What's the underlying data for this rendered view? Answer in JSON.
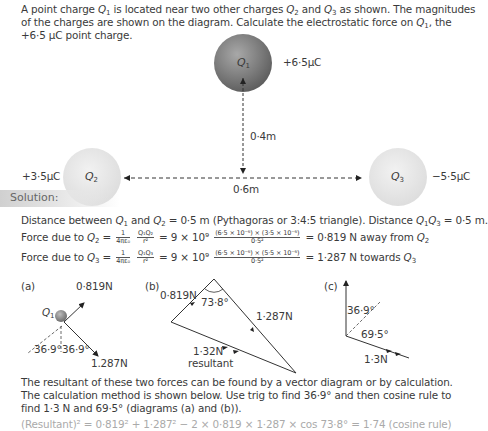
{
  "problem": {
    "text_parts": [
      "A point charge ",
      "Q",
      "1",
      " is located near two other charges ",
      "Q",
      "2",
      " and ",
      "Q",
      "3",
      " as shown. The magnitudes of the charges are shown on the diagram. Calculate the electrostatic force on ",
      "Q",
      "1",
      ", the +6·5 μC point charge."
    ]
  },
  "diagram": {
    "q1": {
      "label": "Q",
      "sub": "1",
      "charge": "+6·5μC",
      "color": "#777777"
    },
    "q2": {
      "label": "Q",
      "sub": "2",
      "charge": "+3·5μC",
      "color": "#e2e2e2"
    },
    "q3": {
      "label": "Q",
      "sub": "3",
      "charge": "−5·5μC",
      "color": "#e2e2e2"
    },
    "vertical_distance": "0·4m",
    "horizontal_distance": "0·6m"
  },
  "solution": {
    "heading": "Solution:",
    "line1": [
      "Distance between ",
      "Q",
      "1",
      " and ",
      "Q",
      "2",
      " = 0·5 m (Pythagoras or 3:4:5 triangle). Distance ",
      "Q",
      "1",
      "Q",
      "3",
      " = 0·5 m."
    ],
    "force_q2": {
      "prefix": "Force due to ",
      "q": "Q",
      "qsub": "2",
      "const_num": "1",
      "const_den": "4πε₀",
      "ratio_num": "Q₁Q₂",
      "ratio_den": "r²",
      "k": "= 9 × 10⁹",
      "num": "(6·5 × 10⁻⁶) × (3·5 × 10⁻⁶)",
      "den": "0·5²",
      "result": "= 0·819 N away from ",
      "target": "Q",
      "target_sub": "2"
    },
    "force_q3": {
      "prefix": "Force due to ",
      "q": "Q",
      "qsub": "3",
      "const_num": "1",
      "const_den": "4πε₀",
      "ratio_num": "Q₁Q₃",
      "ratio_den": "r²",
      "k": "= 9 × 10⁹",
      "num": "(6·5 × 10⁻⁶) × (5·5 × 10⁻⁶)",
      "den": "0·5²",
      "result": "= 1·287 N towards ",
      "target": "Q",
      "target_sub": "3"
    },
    "fig_a": {
      "label": "(a)",
      "f1": "0·819N",
      "f2": "1.287N",
      "q": "Q",
      "qsub": "1",
      "ang1": "36·9°",
      "ang2": "36·9°"
    },
    "fig_b": {
      "label": "(b)",
      "f1": "0·819N",
      "angle": "73·8°",
      "f2": "1·287N",
      "res": "1·32N",
      "res_label": "resultant"
    },
    "fig_c": {
      "label": "(c)",
      "ang1": "36·9°",
      "ang2": "69·5°",
      "res": "1·3N"
    },
    "para": "The resultant of these two forces can be found by a vector diagram or by calculation. The calculation method is shown below. Use trig to find 36·9° and then cosine rule to find 1·3 N and 69·5° (diagrams (a) and (b)).",
    "cutoff_line": "(Resultant)² = 0·819² + 1·287² − 2 × 0·819 × 1·287 × cos 73·8° = 1·74 (cosine rule)"
  }
}
